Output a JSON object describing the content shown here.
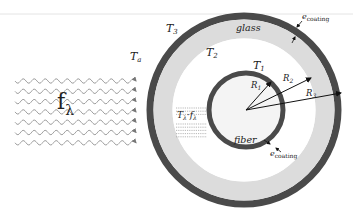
{
  "diagram": {
    "incident_flux_label": "f",
    "incident_flux_sub": "λ",
    "ambient_temp": {
      "base": "T",
      "sub": "a"
    },
    "outer_coating_temp": {
      "base": "T",
      "sub": "3"
    },
    "glass_inner_temp": {
      "base": "T",
      "sub": "2"
    },
    "fiber_temp": {
      "base": "T",
      "sub": "1"
    },
    "glass_label": "glass",
    "fiber_label": "fiber",
    "transmitted_label": {
      "base1": "T",
      "sub1": "λ",
      "sep": "·",
      "base2": "f",
      "sub2": "λ"
    },
    "radius_labels": [
      {
        "base": "R",
        "sub": "1"
      },
      {
        "base": "R",
        "sub": "2"
      },
      {
        "base": "R",
        "sub": "3"
      }
    ],
    "coating_thickness_labels": [
      {
        "base": "e",
        "sub": "coating",
        "position": "outer"
      },
      {
        "base": "e",
        "sub": "coating",
        "position": "fiber"
      }
    ],
    "wave_count": 7,
    "colors": {
      "coating": "#4a4a4a",
      "glass": "#dcdcdc",
      "background": "#ffffff",
      "wave": "#8a8a8a",
      "arrow": "#111111"
    }
  }
}
